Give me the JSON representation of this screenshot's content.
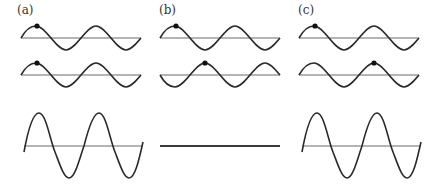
{
  "panels": [
    {
      "label": "(a)",
      "x0": 21,
      "top_wave": {
        "baseline": 38,
        "amplitude": 12,
        "phase_deg": 0,
        "dot_cycle_position": 0.25
      },
      "middle_wave": {
        "baseline": 75,
        "amplitude": 12,
        "phase_deg": 0,
        "dot_cycle_position": 0.25
      },
      "sum_wave": {
        "baseline": 146,
        "amplitude": 33,
        "kind": "sine"
      },
      "description": "in phase - constructive interference"
    },
    {
      "label": "(b)",
      "x0": 160,
      "top_wave": {
        "baseline": 38,
        "amplitude": 12,
        "phase_deg": 0,
        "dot_cycle_position": 0.25
      },
      "middle_wave": {
        "baseline": 75,
        "amplitude": 12,
        "phase_deg": 180,
        "dot_cycle_position": 0.75
      },
      "sum_wave": {
        "baseline": 146,
        "amplitude": 0,
        "kind": "flat"
      },
      "description": "out of phase - destructive interference"
    },
    {
      "label": "(c)",
      "x0": 300,
      "top_wave": {
        "baseline": 38,
        "amplitude": 12,
        "phase_deg": 0,
        "dot_cycle_position": 0.25
      },
      "middle_wave": {
        "baseline": 75,
        "amplitude": 12,
        "phase_deg": 360,
        "dot_cycle_position": 1.25
      },
      "sum_wave": {
        "baseline": 146,
        "amplitude": 33,
        "kind": "sine"
      },
      "description": "shifted by one wavelength - constructive interference"
    }
  ],
  "wave_settings": {
    "width": 120,
    "cycles": 2,
    "color": "#2a2a2a",
    "axis_color": "#6a6a6a"
  }
}
